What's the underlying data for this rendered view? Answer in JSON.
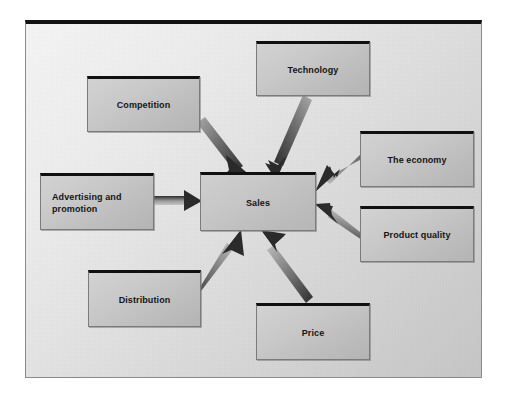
{
  "diagram": {
    "title_visible": false,
    "type": "influence-diagram",
    "center": {
      "id": "sales",
      "label": "Sales",
      "x": 200,
      "y": 172,
      "w": 116,
      "h": 59
    },
    "factors": [
      {
        "id": "competition",
        "label": "Competition",
        "x": 87,
        "y": 76,
        "w": 113,
        "h": 56,
        "align": "center"
      },
      {
        "id": "technology",
        "label": "Technology",
        "x": 256,
        "y": 41,
        "w": 114,
        "h": 55,
        "align": "center"
      },
      {
        "id": "the-economy",
        "label": "The economy",
        "x": 360,
        "y": 131,
        "w": 114,
        "h": 56,
        "align": "center"
      },
      {
        "id": "product-quality",
        "label": "Product quality",
        "x": 360,
        "y": 206,
        "w": 114,
        "h": 56,
        "align": "center"
      },
      {
        "id": "advertising",
        "label": "Advertising and\npromotion",
        "x": 40,
        "y": 173,
        "w": 114,
        "h": 57,
        "align": "left"
      },
      {
        "id": "distribution",
        "label": "Distribution",
        "x": 88,
        "y": 270,
        "w": 113,
        "h": 57,
        "align": "center"
      },
      {
        "id": "price",
        "label": "Price",
        "x": 256,
        "y": 303,
        "w": 114,
        "h": 57,
        "align": "center"
      }
    ],
    "arrows": [
      {
        "id": "arrow-competition-to-sales",
        "from": "competition",
        "to": "sales",
        "direction": "down-right"
      },
      {
        "id": "arrow-technology-to-sales",
        "from": "technology",
        "to": "sales",
        "direction": "down-left"
      },
      {
        "id": "arrow-economy-to-sales",
        "from": "the-economy",
        "to": "sales",
        "direction": "left-down"
      },
      {
        "id": "arrow-product-quality-to-sales",
        "from": "product-quality",
        "to": "sales",
        "direction": "left-up"
      },
      {
        "id": "arrow-advertising-to-sales",
        "from": "advertising",
        "to": "sales",
        "direction": "right"
      },
      {
        "id": "arrow-distribution-to-sales",
        "from": "distribution",
        "to": "sales",
        "direction": "up-right"
      },
      {
        "id": "arrow-price-to-sales",
        "from": "price",
        "to": "sales",
        "direction": "up-left"
      }
    ],
    "colors": {
      "frame_border": "#8a8a8a",
      "frame_top_edge": "#121212",
      "background_light": "#f4f4f4",
      "background_dark": "#c6c6c6",
      "box_fill_light": "#d2d2d2",
      "box_fill_dark": "#b4b4b4",
      "box_top_edge": "#101010",
      "box_border": "#7b7b7b",
      "arrow_dark": "#3a3a3a",
      "arrow_light": "#b9b9b9",
      "text": "#141414"
    }
  }
}
